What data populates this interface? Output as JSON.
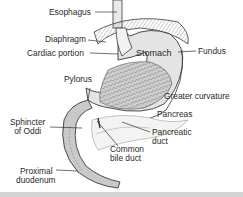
{
  "figure": {
    "type": "anatomical-diagram",
    "colors": {
      "line": "#3a3a3a",
      "shade": "#bdbdbd",
      "light": "#e6e6e6",
      "background": "#ffffff",
      "strip": "#d4d4d4"
    }
  },
  "labels": {
    "esophagus": "Esophagus",
    "diaphragm": "Diaphragm",
    "cardiac_portion": "Cardiac portion",
    "stomach": "Stomach",
    "fundus": "Fundus",
    "pylorus": "Pylorus",
    "greater_curvature": "Greater curvature",
    "sphincter_l1": "Sphincter",
    "sphincter_l2": "of Oddi",
    "pancreas": "Pancreas",
    "pancreatic_duct_l1": "Pancreatic",
    "pancreatic_duct_l2": "duct",
    "common_bile_duct_l1": "Common",
    "common_bile_duct_l2": "bile duct",
    "proximal_duodenum_l1": "Proximal",
    "proximal_duodenum_l2": "duodenum"
  }
}
